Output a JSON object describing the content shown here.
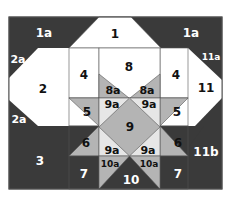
{
  "colors": {
    "dark": "#3a3a3a",
    "mid": "#b4b4b4",
    "light": "#ffffff",
    "line": "#555555",
    "label_on_dark": "#ffffff",
    "label_on_light": "#111111"
  },
  "labels": {
    "p1": "1",
    "p1a_left": "1a",
    "p1a_right": "1a",
    "p2": "2",
    "p2a_top": "2a",
    "p2a_bottom": "2a",
    "p3": "3",
    "p4_left": "4",
    "p4_right": "4",
    "p5_left": "5",
    "p5_right": "5",
    "p6_left": "6",
    "p6_right": "6",
    "p7_left": "7",
    "p7_right": "7",
    "p8": "8",
    "p8a_left": "8a",
    "p8a_right": "8a",
    "p9": "9",
    "p9a_tl": "9a",
    "p9a_tr": "9a",
    "p9a_bl": "9a",
    "p9a_br": "9a",
    "p10": "10",
    "p10a_left": "10a",
    "p10a_right": "10a",
    "p11": "11",
    "p11a": "11a",
    "p11b": "11b"
  }
}
